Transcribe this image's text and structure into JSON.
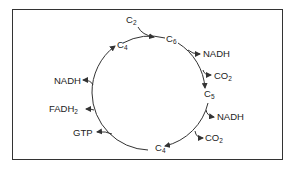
{
  "diagram": {
    "type": "cycle",
    "nodes": [
      {
        "id": "c2",
        "base": "C",
        "sub": "2"
      },
      {
        "id": "c6",
        "base": "C",
        "sub": "6"
      },
      {
        "id": "c5",
        "base": "C",
        "sub": "5"
      },
      {
        "id": "c4_bottom",
        "base": "C",
        "sub": "4"
      },
      {
        "id": "c4_top",
        "base": "C",
        "sub": "4"
      }
    ],
    "outputs": [
      {
        "id": "nadh_1",
        "base": "NADH",
        "sub": ""
      },
      {
        "id": "co2_1",
        "base": "CO",
        "sub": "2"
      },
      {
        "id": "nadh_2",
        "base": "NADH",
        "sub": ""
      },
      {
        "id": "co2_2",
        "base": "CO",
        "sub": "2"
      },
      {
        "id": "gtp",
        "base": "GTP",
        "sub": ""
      },
      {
        "id": "fadh2",
        "base": "FADH",
        "sub": "2"
      },
      {
        "id": "nadh_3",
        "base": "NADH",
        "sub": ""
      }
    ],
    "colors": {
      "line": "#333333",
      "text": "#222222"
    }
  }
}
